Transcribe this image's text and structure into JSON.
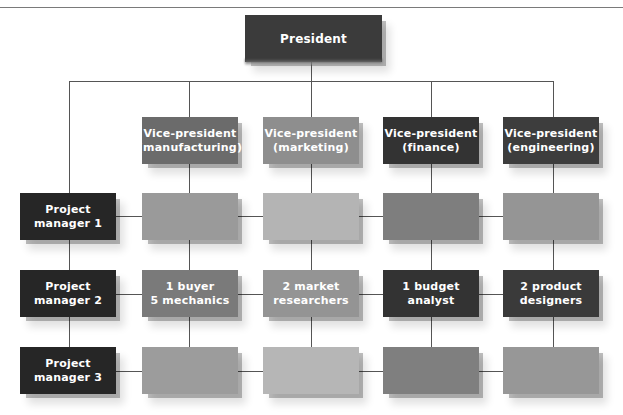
{
  "diagram": {
    "type": "matrix-organization-chart",
    "president": {
      "label": "President",
      "color": "#3b3b3b"
    },
    "vice_presidents": [
      {
        "label": "Vice-president\n(manufacturing)",
        "color": "#6b6b6b"
      },
      {
        "label": "Vice-president\n(marketing)",
        "color": "#8e8e8e"
      },
      {
        "label": "Vice-president\n(finance)",
        "color": "#333333"
      },
      {
        "label": "Vice-president\n(engineering)",
        "color": "#3d3d3d"
      }
    ],
    "project_managers": [
      {
        "label": "Project\nmanager 1",
        "color": "#262626"
      },
      {
        "label": "Project\nmanager  2",
        "color": "#262626"
      },
      {
        "label": "Project\nmanager  3",
        "color": "#262626"
      }
    ],
    "cells": [
      [
        {
          "label": "",
          "color": "#9a9a9a"
        },
        {
          "label": "",
          "color": "#b4b4b4"
        },
        {
          "label": "",
          "color": "#7e7e7e"
        },
        {
          "label": "",
          "color": "#959595"
        }
      ],
      [
        {
          "label": "1 buyer\n5 mechanics",
          "color": "#7a7a7a"
        },
        {
          "label": "2 market\nresearchers",
          "color": "#949494"
        },
        {
          "label": "1 budget\nanalyst",
          "color": "#333333"
        },
        {
          "label": "2 product\ndesigners",
          "color": "#3a3a3a"
        }
      ],
      [
        {
          "label": "",
          "color": "#9c9c9c"
        },
        {
          "label": "",
          "color": "#b6b6b6"
        },
        {
          "label": "",
          "color": "#7f7f7f"
        },
        {
          "label": "",
          "color": "#979797"
        }
      ]
    ]
  }
}
